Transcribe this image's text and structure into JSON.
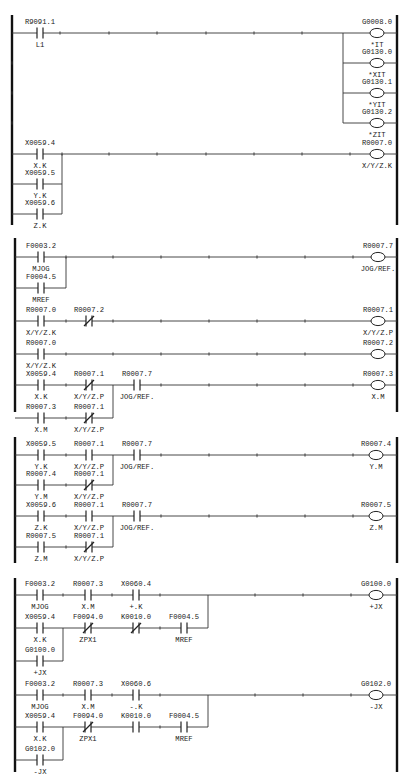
{
  "sections": [
    {
      "id": "s1",
      "rail": {
        "top": 15,
        "bottom": 225,
        "left": 12,
        "right": 397
      },
      "rungs": [
        {
          "y": 33,
          "left_ticks": true
        },
        {
          "y": 63,
          "left_ticks": true
        },
        {
          "y": 93,
          "left_ticks": true
        },
        {
          "y": 123,
          "left_ticks": true
        },
        {
          "y": 154
        }
      ],
      "wires": [
        [
          12,
          33,
          397,
          33
        ],
        [
          343,
          33,
          343,
          123
        ],
        [
          343,
          63,
          397,
          63
        ],
        [
          343,
          93,
          397,
          93
        ],
        [
          343,
          123,
          397,
          123
        ],
        [
          12,
          154,
          397,
          154
        ],
        [
          12,
          184,
          62,
          184
        ],
        [
          62,
          154,
          62,
          214
        ],
        [
          12,
          214,
          62,
          214
        ]
      ],
      "ticks": [
        [
          60,
          33
        ],
        [
          109,
          33
        ],
        [
          157,
          33
        ],
        [
          206,
          33
        ],
        [
          254,
          33
        ],
        [
          302,
          33
        ],
        [
          12,
          63
        ],
        [
          12,
          93
        ],
        [
          12,
          123
        ],
        [
          62,
          154
        ],
        [
          109,
          154
        ],
        [
          157,
          154
        ],
        [
          206,
          154
        ],
        [
          254,
          154
        ],
        [
          302,
          154
        ],
        [
          350,
          154
        ]
      ],
      "contacts": [
        {
          "x": 40,
          "y": 33,
          "type": "NO",
          "addr": "R9091.1",
          "label": "L1"
        },
        {
          "x": 40,
          "y": 154,
          "type": "NO",
          "addr": "X0059.4",
          "label": "X.K"
        },
        {
          "x": 40,
          "y": 184,
          "type": "NO",
          "addr": "X0059.5",
          "label": "Y.K"
        },
        {
          "x": 40,
          "y": 214,
          "type": "NO",
          "addr": "X0059.6",
          "label": "Z.K"
        }
      ],
      "coils": [
        {
          "x": 377,
          "y": 33,
          "addr": "G0008.0",
          "label": "*IT"
        },
        {
          "x": 377,
          "y": 63,
          "addr": "G0130.0",
          "label": "*XIT"
        },
        {
          "x": 377,
          "y": 93,
          "addr": "G0130.1",
          "label": "*YIT"
        },
        {
          "x": 377,
          "y": 123,
          "addr": "G0130.2",
          "label": "*ZIT"
        },
        {
          "x": 377,
          "y": 154,
          "addr": "R0007.0",
          "label": "X/Y/Z.K"
        }
      ]
    },
    {
      "id": "s2",
      "rail": {
        "top": 238,
        "bottom": 412,
        "left": 15,
        "right": 397
      },
      "wires": [
        [
          15,
          257,
          397,
          257
        ],
        [
          66,
          257,
          66,
          288
        ],
        [
          15,
          288,
          66,
          288
        ],
        [
          15,
          321,
          397,
          321
        ],
        [
          15,
          354,
          397,
          354
        ],
        [
          15,
          385,
          397,
          385
        ],
        [
          113,
          385,
          113,
          418
        ],
        [
          15,
          418,
          113,
          418
        ]
      ],
      "ticks": [
        [
          66,
          257
        ],
        [
          113,
          257
        ],
        [
          161,
          257
        ],
        [
          209,
          257
        ],
        [
          257,
          257
        ],
        [
          305,
          257
        ],
        [
          353,
          257
        ],
        [
          66,
          321
        ],
        [
          113,
          321
        ],
        [
          161,
          321
        ],
        [
          209,
          321
        ],
        [
          257,
          321
        ],
        [
          305,
          321
        ],
        [
          66,
          354
        ],
        [
          113,
          354
        ],
        [
          161,
          354
        ],
        [
          209,
          354
        ],
        [
          257,
          354
        ],
        [
          305,
          354
        ],
        [
          66,
          385
        ],
        [
          161,
          385
        ],
        [
          209,
          385
        ],
        [
          257,
          385
        ],
        [
          305,
          385
        ],
        [
          353,
          385
        ],
        [
          66,
          418
        ]
      ],
      "contacts": [
        {
          "x": 41,
          "y": 257,
          "type": "NO",
          "addr": "F0003.2",
          "label": "MJOG"
        },
        {
          "x": 41,
          "y": 288,
          "type": "NO",
          "addr": "F0004.5",
          "label": "MREF"
        },
        {
          "x": 41,
          "y": 321,
          "type": "NO",
          "addr": "R0007.0",
          "label": "X/Y/Z.K"
        },
        {
          "x": 89,
          "y": 321,
          "type": "NC",
          "addr": "R0007.2",
          "label": ""
        },
        {
          "x": 41,
          "y": 354,
          "type": "NO",
          "addr": "R0007.0",
          "label": "X/Y/Z.K"
        },
        {
          "x": 41,
          "y": 385,
          "type": "NO",
          "addr": "X0059.4",
          "label": "X.K"
        },
        {
          "x": 89,
          "y": 385,
          "type": "NC",
          "addr": "R0007.1",
          "label": "X/Y/Z.P"
        },
        {
          "x": 137,
          "y": 385,
          "type": "NO",
          "addr": "R0007.7",
          "label": "JOG/REF."
        },
        {
          "x": 41,
          "y": 418,
          "type": "NO",
          "addr": "R0007.3",
          "label": "X.M"
        },
        {
          "x": 89,
          "y": 418,
          "type": "NC",
          "addr": "R0007.1",
          "label": "X/Y/Z.P"
        }
      ],
      "coils": [
        {
          "x": 378,
          "y": 257,
          "addr": "R0007.7",
          "label": "JOG/REF."
        },
        {
          "x": 378,
          "y": 321,
          "addr": "R0007.1",
          "label": "X/Y/Z.P"
        },
        {
          "x": 378,
          "y": 354,
          "addr": "R0007.2",
          "label": ""
        },
        {
          "x": 378,
          "y": 385,
          "addr": "R0007.3",
          "label": "X.M"
        }
      ]
    },
    {
      "id": "s3",
      "rail": {
        "top": 437,
        "bottom": 563,
        "left": 15,
        "right": 397
      },
      "wires": [
        [
          15,
          455,
          397,
          455
        ],
        [
          113,
          455,
          113,
          485
        ],
        [
          15,
          485,
          113,
          485
        ],
        [
          15,
          516,
          397,
          516
        ],
        [
          113,
          516,
          113,
          547
        ],
        [
          15,
          547,
          113,
          547
        ]
      ],
      "ticks": [
        [
          66,
          455
        ],
        [
          161,
          455
        ],
        [
          209,
          455
        ],
        [
          257,
          455
        ],
        [
          305,
          455
        ],
        [
          353,
          455
        ],
        [
          66,
          485
        ],
        [
          66,
          516
        ],
        [
          161,
          516
        ],
        [
          209,
          516
        ],
        [
          257,
          516
        ],
        [
          305,
          516
        ],
        [
          353,
          516
        ],
        [
          66,
          547
        ]
      ],
      "contacts": [
        {
          "x": 41,
          "y": 455,
          "type": "NO",
          "addr": "X0059.5",
          "label": "Y.K"
        },
        {
          "x": 89,
          "y": 455,
          "type": "NO",
          "addr": "R0007.1",
          "label": "X/Y/Z.P"
        },
        {
          "x": 137,
          "y": 455,
          "type": "NO",
          "addr": "R0007.7",
          "label": "JOG/REF."
        },
        {
          "x": 41,
          "y": 485,
          "type": "NO",
          "addr": "R0007.4",
          "label": "Y.M"
        },
        {
          "x": 89,
          "y": 485,
          "type": "NC",
          "addr": "R0007.1",
          "label": "X/Y/Z.P"
        },
        {
          "x": 41,
          "y": 516,
          "type": "NO",
          "addr": "X0059.6",
          "label": "Z.K"
        },
        {
          "x": 89,
          "y": 516,
          "type": "NO",
          "addr": "R0007.1",
          "label": "X/Y/Z.P"
        },
        {
          "x": 137,
          "y": 516,
          "type": "NO",
          "addr": "R0007.7",
          "label": "JOG/REF."
        },
        {
          "x": 41,
          "y": 547,
          "type": "NO",
          "addr": "R0007.5",
          "label": "Z.M"
        },
        {
          "x": 89,
          "y": 547,
          "type": "NC",
          "addr": "R0007.1",
          "label": "X/Y/Z.P"
        }
      ],
      "coils": [
        {
          "x": 376,
          "y": 455,
          "addr": "R0007.4",
          "label": "Y.M"
        },
        {
          "x": 376,
          "y": 516,
          "addr": "R0007.5",
          "label": "Z.M"
        }
      ]
    },
    {
      "id": "s4",
      "rail": {
        "top": 578,
        "bottom": 772,
        "left": 15,
        "right": 397
      },
      "wires": [
        [
          15,
          595,
          397,
          595
        ],
        [
          208,
          595,
          208,
          628
        ],
        [
          63,
          628,
          208,
          628
        ],
        [
          15,
          628,
          63,
          628
        ],
        [
          63,
          628,
          63,
          661
        ],
        [
          15,
          661,
          63,
          661
        ],
        [
          15,
          695,
          397,
          695
        ],
        [
          208,
          695,
          208,
          727
        ],
        [
          63,
          727,
          208,
          727
        ],
        [
          15,
          727,
          63,
          727
        ],
        [
          63,
          727,
          63,
          760
        ],
        [
          15,
          760,
          63,
          760
        ]
      ],
      "ticks": [
        [
          63,
          595
        ],
        [
          112,
          595
        ],
        [
          160,
          595
        ],
        [
          255,
          595
        ],
        [
          303,
          595
        ],
        [
          351,
          595
        ],
        [
          160,
          628
        ],
        [
          63,
          695
        ],
        [
          112,
          695
        ],
        [
          160,
          695
        ],
        [
          255,
          695
        ],
        [
          303,
          695
        ],
        [
          351,
          695
        ],
        [
          160,
          727
        ]
      ],
      "contacts": [
        {
          "x": 40,
          "y": 595,
          "type": "NO",
          "addr": "F0003.2",
          "label": "MJOG"
        },
        {
          "x": 88,
          "y": 595,
          "type": "NO",
          "addr": "R0007.3",
          "label": "X.M"
        },
        {
          "x": 136,
          "y": 595,
          "type": "NO",
          "addr": "X0060.4",
          "label": "+.K"
        },
        {
          "x": 40,
          "y": 628,
          "type": "NO",
          "addr": "X0059.4",
          "label": "X.K"
        },
        {
          "x": 88,
          "y": 628,
          "type": "NC",
          "addr": "F0094.0",
          "label": "ZPX1"
        },
        {
          "x": 136,
          "y": 628,
          "type": "NC",
          "addr": "K0010.0",
          "label": ""
        },
        {
          "x": 184,
          "y": 628,
          "type": "NO",
          "addr": "F0004.5",
          "label": "MREF"
        },
        {
          "x": 40,
          "y": 661,
          "type": "NO",
          "addr": "G0100.0",
          "label": "+JX"
        },
        {
          "x": 40,
          "y": 695,
          "type": "NO",
          "addr": "F0003.2",
          "label": "MJOG"
        },
        {
          "x": 88,
          "y": 695,
          "type": "NO",
          "addr": "R0007.3",
          "label": "X.M"
        },
        {
          "x": 136,
          "y": 695,
          "type": "NO",
          "addr": "X0060.6",
          "label": "-.K"
        },
        {
          "x": 40,
          "y": 727,
          "type": "NO",
          "addr": "X0059.4",
          "label": "X.K"
        },
        {
          "x": 88,
          "y": 727,
          "type": "NC",
          "addr": "F0094.0",
          "label": "ZPX1"
        },
        {
          "x": 136,
          "y": 727,
          "type": "NO",
          "addr": "K0010.0",
          "label": ""
        },
        {
          "x": 184,
          "y": 727,
          "type": "NO",
          "addr": "F0004.5",
          "label": "MREF"
        },
        {
          "x": 40,
          "y": 760,
          "type": "NO",
          "addr": "G0102.0",
          "label": "-JX"
        }
      ],
      "coils": [
        {
          "x": 376,
          "y": 595,
          "addr": "G0100.0",
          "label": "+JX"
        },
        {
          "x": 376,
          "y": 695,
          "addr": "G0102.0",
          "label": "-JX"
        }
      ]
    }
  ]
}
